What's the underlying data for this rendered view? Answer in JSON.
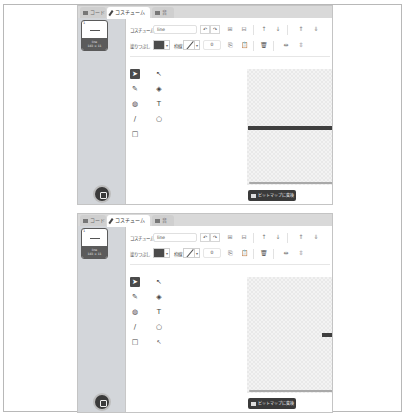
{
  "panels": [
    {
      "tabs": [
        {
          "label": "コード",
          "icon": "code-icon",
          "selected": false
        },
        {
          "label": "コスチューム",
          "icon": "brush-icon",
          "selected": true
        },
        {
          "label": "音",
          "icon": "sound-icon",
          "selected": false
        }
      ],
      "costume_list": [
        {
          "number": "1",
          "name": "line",
          "size": "183 × 11",
          "selected": true
        }
      ],
      "toolbar": {
        "costume_label": "コスチューム",
        "costume_name": "line",
        "undo": "↶",
        "redo": "↷",
        "group": "⊞",
        "ungroup": "⊟",
        "forward": "↑",
        "backward": "↓",
        "front": "⇑",
        "back": "⇓",
        "fill_label": "塗りつぶし",
        "fill_color": "#4b4b4b",
        "outline_label": "枠線",
        "size_value": "0",
        "copy": "⎘",
        "paste": "📋",
        "delete": "🗑",
        "flip_h": "⇹",
        "flip_v": "⇳"
      },
      "tools": [
        {
          "name": "select",
          "glyph": "➤",
          "selected": true
        },
        {
          "name": "reshape",
          "glyph": "↖",
          "selected": false
        },
        {
          "name": "brush",
          "glyph": "✎",
          "selected": false
        },
        {
          "name": "eraser",
          "glyph": "◈",
          "selected": false
        },
        {
          "name": "fill",
          "glyph": "◍",
          "selected": false
        },
        {
          "name": "text",
          "glyph": "T",
          "selected": false
        },
        {
          "name": "line",
          "glyph": "/",
          "selected": false
        },
        {
          "name": "circle",
          "glyph": "○",
          "selected": false
        },
        {
          "name": "rectangle",
          "glyph": "□",
          "selected": false
        }
      ],
      "convert_button": "ビットマップに変換",
      "zoom": {
        "out": "−",
        "reset": "=",
        "in": "+"
      }
    },
    {
      "tabs": [
        {
          "label": "コード",
          "icon": "code-icon",
          "selected": false
        },
        {
          "label": "コスチューム",
          "icon": "brush-icon",
          "selected": true
        },
        {
          "label": "音",
          "icon": "sound-icon",
          "selected": false
        }
      ],
      "costume_list": [
        {
          "number": "1",
          "name": "line",
          "size": "183 × 11",
          "selected": true
        }
      ],
      "toolbar": {
        "costume_label": "コスチューム",
        "costume_name": "line",
        "undo": "↶",
        "redo": "↷",
        "group": "⊞",
        "ungroup": "⊟",
        "forward": "↑",
        "backward": "↓",
        "front": "⇑",
        "back": "⇓",
        "fill_label": "塗りつぶし",
        "fill_color": "#4b4b4b",
        "outline_label": "枠線",
        "size_value": "0",
        "copy": "⎘",
        "paste": "📋",
        "delete": "🗑",
        "flip_h": "⇹",
        "flip_v": "⇳"
      },
      "tools": [
        {
          "name": "select",
          "glyph": "➤",
          "selected": true
        },
        {
          "name": "reshape",
          "glyph": "↖",
          "selected": false
        },
        {
          "name": "brush",
          "glyph": "✎",
          "selected": false
        },
        {
          "name": "eraser",
          "glyph": "◈",
          "selected": false
        },
        {
          "name": "fill",
          "glyph": "◍",
          "selected": false
        },
        {
          "name": "text",
          "glyph": "T",
          "selected": false
        },
        {
          "name": "line",
          "glyph": "/",
          "selected": false
        },
        {
          "name": "circle",
          "glyph": "○",
          "selected": false
        },
        {
          "name": "rectangle",
          "glyph": "□",
          "selected": false
        },
        {
          "name": "pointer",
          "glyph": "↖",
          "selected": false
        }
      ],
      "convert_button": "ビットマップに変換",
      "zoom": {
        "out": "−",
        "reset": "=",
        "in": "+"
      }
    }
  ]
}
